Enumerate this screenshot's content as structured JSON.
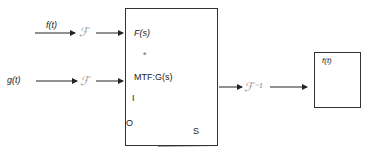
{
  "inputs": {
    "f": {
      "label": "f(t)",
      "transform": "ℱ"
    },
    "g": {
      "label": "g(t)",
      "transform": "ℱ"
    }
  },
  "main_box": {
    "top_label": "F(s)",
    "operator": "*",
    "mtf_label": "MTF:G(s)",
    "graph": {
      "y_top_tick": "I",
      "y_origin": "O",
      "x_label": "S"
    }
  },
  "inverse": {
    "label": "ℱ⁻¹"
  },
  "output_box": {
    "label": "f(t)"
  }
}
